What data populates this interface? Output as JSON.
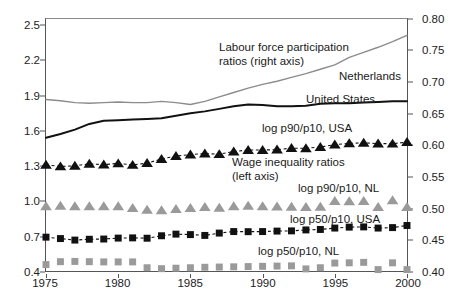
{
  "chart_data": {
    "type": "line",
    "title": "",
    "xlabel": "",
    "ylabel": "",
    "xlim": [
      1975,
      2000
    ],
    "ylim": [
      0.4,
      2.56
    ],
    "y2lim": [
      0.4,
      0.801
    ],
    "grid": false,
    "legend_position": "inline-annotations",
    "x_ticks": [
      "1975",
      "1980",
      "1985",
      "1990",
      "1995",
      "2000"
    ],
    "x_tick_values": [
      1975,
      1980,
      1985,
      1990,
      1995,
      2000
    ],
    "left_axis_label": "Wage inequality ratios (left axis)",
    "right_axis_label": "Labour force participation ratios (right axis)",
    "left_ticks": [
      "0.4",
      "0.7",
      "1.0",
      "1.3",
      "1.6",
      "1.9",
      "2.2",
      "2.5"
    ],
    "left_tick_values": [
      0.4,
      0.7,
      1.0,
      1.3,
      1.6,
      1.9,
      2.2,
      2.5
    ],
    "right_ticks": [
      "0.40",
      "0.45",
      "0.50",
      "0.55",
      "0.60",
      "0.65",
      "0.70",
      "0.75",
      "0.80"
    ],
    "right_tick_values": [
      0.4,
      0.45,
      0.5,
      0.55,
      0.6,
      0.65,
      0.7,
      0.75,
      0.8
    ],
    "x": [
      1975,
      1976,
      1977,
      1978,
      1979,
      1980,
      1981,
      1982,
      1983,
      1984,
      1985,
      1986,
      1987,
      1988,
      1989,
      1990,
      1991,
      1992,
      1993,
      1994,
      1995,
      1996,
      1997,
      1998,
      1999,
      2000
    ],
    "series": [
      {
        "name": "Netherlands",
        "label": "Netherlands",
        "axis": "right",
        "style": "line",
        "color": "#8c8c8c",
        "values": [
          0.673,
          0.671,
          0.668,
          0.667,
          0.668,
          0.669,
          0.668,
          0.668,
          0.67,
          0.668,
          0.665,
          0.67,
          0.677,
          0.684,
          0.691,
          0.697,
          0.702,
          0.708,
          0.714,
          0.721,
          0.728,
          0.74,
          0.748,
          0.756,
          0.765,
          0.775
        ]
      },
      {
        "name": "United States",
        "label": "United States",
        "axis": "right",
        "style": "line",
        "color": "#111111",
        "values": [
          0.612,
          0.618,
          0.625,
          0.634,
          0.639,
          0.64,
          0.641,
          0.642,
          0.643,
          0.647,
          0.651,
          0.654,
          0.658,
          0.662,
          0.665,
          0.664,
          0.662,
          0.662,
          0.663,
          0.666,
          0.667,
          0.667,
          0.668,
          0.669,
          0.67,
          0.67
        ]
      },
      {
        "name": "log p90/p10, USA",
        "label": "log p90/p10, USA",
        "axis": "left",
        "style": "dashed-markers",
        "marker": "triangle",
        "color": "#111111",
        "values": [
          1.31,
          1.296,
          1.302,
          1.318,
          1.312,
          1.322,
          1.309,
          1.325,
          1.36,
          1.385,
          1.398,
          1.406,
          1.401,
          1.424,
          1.437,
          1.437,
          1.44,
          1.453,
          1.452,
          1.463,
          1.483,
          1.494,
          1.499,
          1.492,
          1.491,
          1.505
        ]
      },
      {
        "name": "log p90/p10, NL",
        "label": "log p90/p10, NL",
        "axis": "left",
        "style": "markers",
        "marker": "triangle",
        "color": "#9a9a9a",
        "values": [
          0.955,
          0.958,
          0.955,
          0.955,
          0.955,
          0.955,
          0.94,
          0.925,
          0.92,
          0.93,
          0.94,
          0.948,
          0.942,
          0.955,
          0.958,
          0.955,
          0.952,
          0.95,
          0.948,
          0.95,
          1.0,
          0.998,
          1.0,
          0.948,
          1.005,
          0.948
        ]
      },
      {
        "name": "log p50/p10, USA",
        "label": "log p50/p10, USA",
        "axis": "left",
        "style": "dashed-markers",
        "marker": "square",
        "color": "#111111",
        "values": [
          0.69,
          0.678,
          0.665,
          0.672,
          0.674,
          0.682,
          0.684,
          0.681,
          0.702,
          0.716,
          0.712,
          0.705,
          0.725,
          0.738,
          0.737,
          0.738,
          0.742,
          0.744,
          0.752,
          0.756,
          0.768,
          0.776,
          0.778,
          0.768,
          0.772,
          0.79
        ]
      },
      {
        "name": "log p50/p10, NL",
        "label": "log p50/p10, NL",
        "axis": "left",
        "style": "markers",
        "marker": "square",
        "color": "#9a9a9a",
        "values": [
          0.455,
          0.48,
          0.482,
          0.48,
          0.478,
          0.478,
          0.478,
          0.428,
          0.42,
          0.424,
          0.428,
          0.432,
          0.434,
          0.436,
          0.438,
          0.44,
          0.442,
          0.444,
          0.418,
          0.428,
          0.468,
          0.47,
          0.474,
          0.412,
          0.47,
          0.412
        ]
      }
    ],
    "annotations": [
      {
        "id": "lfp-note",
        "text": "Labour force participation\nratios (right axis)"
      },
      {
        "id": "netherlands-label",
        "text": "Netherlands"
      },
      {
        "id": "united-states-label",
        "text": "United States"
      },
      {
        "id": "p90p10-usa-label",
        "text": "log p90/p10, USA"
      },
      {
        "id": "wage-note",
        "text": "Wage inequality ratios\n(left axis)"
      },
      {
        "id": "p90p10-nl-label",
        "text": "log p90/p10, NL"
      },
      {
        "id": "p50p10-usa-label",
        "text": "log p50/p10, USA"
      },
      {
        "id": "p50p10-nl-label",
        "text": "log p50/p10, NL"
      }
    ]
  }
}
